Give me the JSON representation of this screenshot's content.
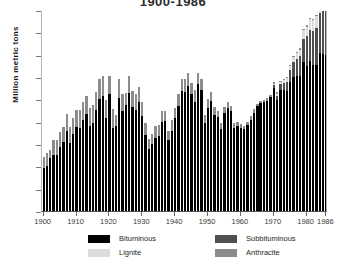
{
  "chart_data": {
    "type": "bar",
    "stacked": true,
    "title": "1900-1986",
    "xlabel": "",
    "ylabel": "Million metric tons",
    "ylim": [
      0,
      900
    ],
    "ytick_values": [
      0,
      100,
      200,
      300,
      400,
      500,
      600,
      700,
      800,
      900
    ],
    "xtick_labels": [
      "1900",
      "1910",
      "1920",
      "1930",
      "1940",
      "1950",
      "1960",
      "1970",
      "1980",
      "1986"
    ],
    "xtick_values": [
      1900,
      1910,
      1920,
      1930,
      1940,
      1950,
      1960,
      1970,
      1980,
      1986
    ],
    "grid": false,
    "legend_position": "bottom",
    "colors": {
      "bituminous": "#000000",
      "subbituminous": "#4f4f4f",
      "lignite": "#dcdcdc",
      "anthracite": "#8c8c8c"
    },
    "x": [
      1900,
      1901,
      1902,
      1903,
      1904,
      1905,
      1906,
      1907,
      1908,
      1909,
      1910,
      1911,
      1912,
      1913,
      1914,
      1915,
      1916,
      1917,
      1918,
      1919,
      1920,
      1921,
      1922,
      1923,
      1924,
      1925,
      1926,
      1927,
      1928,
      1929,
      1930,
      1931,
      1932,
      1933,
      1934,
      1935,
      1936,
      1937,
      1938,
      1939,
      1940,
      1941,
      1942,
      1943,
      1944,
      1945,
      1946,
      1947,
      1948,
      1949,
      1950,
      1951,
      1952,
      1953,
      1954,
      1955,
      1956,
      1957,
      1958,
      1959,
      1960,
      1961,
      1962,
      1963,
      1964,
      1965,
      1966,
      1967,
      1968,
      1969,
      1970,
      1971,
      1972,
      1973,
      1974,
      1975,
      1976,
      1977,
      1978,
      1979,
      1980,
      1981,
      1982,
      1983,
      1984,
      1985,
      1986
    ],
    "series": [
      {
        "name": "Bituminous",
        "values": [
          191,
          200,
          236,
          252,
          250,
          286,
          310,
          357,
          303,
          343,
          377,
          372,
          409,
          434,
          380,
          394,
          454,
          501,
          516,
          418,
          523,
          373,
          380,
          505,
          446,
          473,
          528,
          466,
          454,
          489,
          424,
          342,
          277,
          299,
          327,
          338,
          397,
          401,
          316,
          359,
          417,
          471,
          537,
          535,
          561,
          523,
          489,
          568,
          540,
          392,
          461,
          493,
          429,
          419,
          367,
          441,
          460,
          448,
          373,
          380,
          372,
          366,
          383,
          409,
          439,
          468,
          483,
          488,
          494,
          512,
          549,
          498,
          543,
          541,
          538,
          578,
          600,
          603,
          604,
          667,
          650,
          671,
          656,
          653,
          708,
          702,
          700
        ]
      },
      {
        "name": "Subbituminous",
        "values": [
          0,
          0,
          0,
          0,
          0,
          0,
          0,
          0,
          0,
          0,
          0,
          0,
          0,
          0,
          0,
          0,
          0,
          0,
          0,
          0,
          0,
          0,
          0,
          0,
          0,
          0,
          0,
          0,
          0,
          0,
          0,
          0,
          0,
          0,
          0,
          0,
          0,
          0,
          0,
          0,
          0,
          0,
          0,
          0,
          0,
          0,
          0,
          0,
          0,
          0,
          0,
          0,
          0,
          0,
          0,
          0,
          0,
          0,
          0,
          0,
          0,
          0,
          0,
          0,
          0,
          0,
          0,
          0,
          0,
          0,
          14,
          19,
          25,
          32,
          41,
          54,
          66,
          78,
          89,
          104,
          132,
          140,
          152,
          168,
          180,
          193,
          205
        ]
      },
      {
        "name": "Lignite",
        "values": [
          0,
          0,
          0,
          0,
          0,
          0,
          0,
          0,
          0,
          0,
          0,
          0,
          0,
          0,
          0,
          0,
          0,
          0,
          0,
          0,
          0,
          0,
          0,
          0,
          0,
          0,
          0,
          0,
          0,
          0,
          0,
          0,
          0,
          0,
          0,
          0,
          0,
          0,
          0,
          0,
          0,
          0,
          0,
          0,
          0,
          0,
          0,
          0,
          0,
          0,
          0,
          0,
          0,
          0,
          0,
          0,
          0,
          0,
          0,
          0,
          0,
          0,
          0,
          0,
          0,
          0,
          0,
          0,
          0,
          0,
          7,
          8,
          10,
          13,
          16,
          18,
          22,
          25,
          30,
          38,
          44,
          47,
          49,
          52,
          56,
          66,
          73
        ]
      },
      {
        "name": "Anthracite",
        "values": [
          52,
          59,
          38,
          67,
          67,
          70,
          65,
          79,
          75,
          75,
          76,
          81,
          78,
          83,
          82,
          80,
          80,
          89,
          89,
          79,
          81,
          82,
          50,
          84,
          79,
          56,
          77,
          71,
          69,
          67,
          62,
          54,
          45,
          44,
          52,
          48,
          49,
          46,
          41,
          47,
          46,
          51,
          54,
          55,
          57,
          49,
          55,
          52,
          53,
          38,
          40,
          38,
          36,
          27,
          27,
          24,
          26,
          23,
          19,
          19,
          17,
          16,
          15,
          17,
          16,
          13,
          11,
          11,
          10,
          9,
          8,
          7,
          6,
          6,
          5,
          5,
          5,
          5,
          5,
          5,
          5,
          5,
          4,
          4,
          4,
          4,
          4
        ]
      }
    ]
  },
  "legend": {
    "items": [
      {
        "label": "Bituminous",
        "color": "#000000"
      },
      {
        "label": "Subbituminous",
        "color": "#4f4f4f"
      },
      {
        "label": "Lignite",
        "color": "#dcdcdc"
      },
      {
        "label": "Anthracite",
        "color": "#8c8c8c"
      }
    ]
  }
}
